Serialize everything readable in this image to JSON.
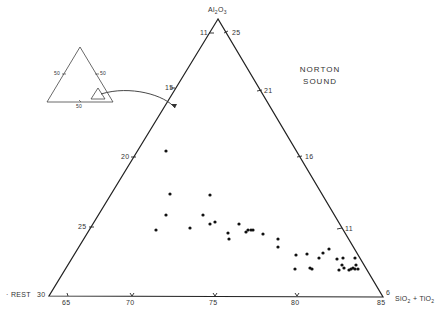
{
  "title": {
    "line1": "NORTON",
    "line2": "SOUND"
  },
  "apex_label": {
    "pre": "Al",
    "sub1": "2",
    "mid": "O",
    "sub2": "3"
  },
  "left_label": "REST",
  "right_label": {
    "a": "SiO",
    "sub1": "2",
    "plus": " + TiO",
    "sub2": "2"
  },
  "inset": {
    "left_tick": "50",
    "right_tick": "50",
    "bottom_tick": "50"
  },
  "ticks": {
    "apex_left": "11",
    "apex_right": "25",
    "left_15": "15",
    "left_20": "20",
    "left_25": "25",
    "left_30": "30",
    "right_21": "21",
    "right_16": "16",
    "right_11": "11",
    "right_6": "6",
    "bottom_65": "65",
    "bottom_70": "70",
    "bottom_75": "75",
    "bottom_80": "80",
    "bottom_85": "85"
  },
  "chart_data": {
    "type": "scatter",
    "subtype": "ternary",
    "title": "NORTON SOUND",
    "axes": {
      "top": "Al2O3",
      "left": "REST",
      "right": "SiO2 + TiO2"
    },
    "left_edge_ticks": [
      11,
      15,
      20,
      25,
      30
    ],
    "right_edge_ticks": [
      25,
      21,
      16,
      11,
      6
    ],
    "bottom_edge_ticks": [
      65,
      70,
      75,
      80,
      85
    ],
    "inset": "full ternary diagram with 50% ticks showing the zoomed sub-triangle location",
    "points_px": [
      [
        166,
        151
      ],
      [
        170,
        194
      ],
      [
        210,
        195
      ],
      [
        166,
        215
      ],
      [
        203,
        215
      ],
      [
        156,
        230
      ],
      [
        190,
        228
      ],
      [
        210,
        224
      ],
      [
        215,
        222
      ],
      [
        228,
        233
      ],
      [
        229,
        239
      ],
      [
        239,
        224
      ],
      [
        246,
        232
      ],
      [
        248,
        230
      ],
      [
        251,
        230
      ],
      [
        253,
        230
      ],
      [
        263,
        234
      ],
      [
        278,
        239
      ],
      [
        278,
        247
      ],
      [
        296,
        255
      ],
      [
        307,
        254
      ],
      [
        319,
        258
      ],
      [
        323,
        253
      ],
      [
        329,
        249
      ],
      [
        337,
        259
      ],
      [
        343,
        258
      ],
      [
        295,
        269
      ],
      [
        310,
        268
      ],
      [
        312,
        269
      ],
      [
        339,
        270
      ],
      [
        342,
        265
      ],
      [
        344,
        268
      ],
      [
        349,
        270
      ],
      [
        351,
        269
      ],
      [
        353,
        268
      ],
      [
        355,
        258
      ],
      [
        355,
        269
      ],
      [
        356,
        265
      ],
      [
        358,
        269
      ]
    ]
  }
}
